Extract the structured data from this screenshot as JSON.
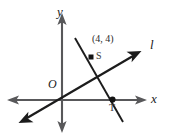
{
  "figure": {
    "background_color": "#ffffff",
    "width": 175,
    "height": 135,
    "axes": {
      "y_axis_label": "y",
      "x_axis_label": "x",
      "origin_label": "O",
      "axis_color": "#58585a"
    },
    "lines": [
      {
        "name": "line-l",
        "label": "l",
        "color": "#1c1c1c",
        "description": "line through origin with arrowheads at both ends",
        "arrowheads": [
          "up-right",
          "down-left"
        ]
      },
      {
        "name": "steep-line",
        "label": "",
        "color": "#1c1c1c",
        "description": "steep descending line through S and T",
        "arrowheads": []
      }
    ],
    "points": [
      {
        "name": "point-s",
        "label": "S",
        "coordinate_label": "(4, 4)",
        "marker": "square",
        "color": "#141414"
      },
      {
        "name": "point-t",
        "label": "T",
        "coordinate_label": "",
        "marker": "dot",
        "color": "#141414"
      }
    ]
  }
}
